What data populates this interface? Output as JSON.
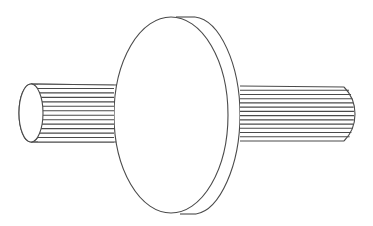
{
  "figure": {
    "description": "Line drawing of a splined shaft passing through a circular disk (flange)",
    "stroke_color": "#4a4a4a",
    "background": "#ffffff"
  },
  "parts": {
    "left_shaft": {
      "label": "left splined shaft segment",
      "spline_lines": 12
    },
    "disk": {
      "label": "circular disk / flange"
    },
    "right_shaft": {
      "label": "right splined shaft segment",
      "spline_lines": 12
    }
  }
}
